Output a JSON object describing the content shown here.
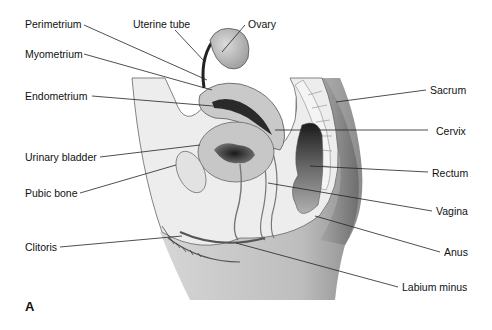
{
  "figure": {
    "panel_letter": "A",
    "type": "anatomical-diagram",
    "colors": {
      "background": "#ffffff",
      "tissue_light": "#ededed",
      "tissue_mid": "#c8c8c8",
      "tissue_dark": "#8a8a8a",
      "cavity_dark": "#1e1e1e",
      "outline": "#555555",
      "leader_line": "#222222",
      "text": "#111111"
    }
  },
  "labels": {
    "perimetrium": "Perimetrium",
    "uterine_tube": "Uterine tube",
    "ovary": "Ovary",
    "myometrium": "Myometrium",
    "endometrium": "Endometrium",
    "sacrum": "Sacrum",
    "cervix": "Cervix",
    "urinary_bladder": "Urinary bladder",
    "rectum": "Rectum",
    "pubic_bone": "Pubic bone",
    "vagina": "Vagina",
    "clitoris": "Clitoris",
    "anus": "Anus",
    "labium_minus": "Labium minus"
  }
}
